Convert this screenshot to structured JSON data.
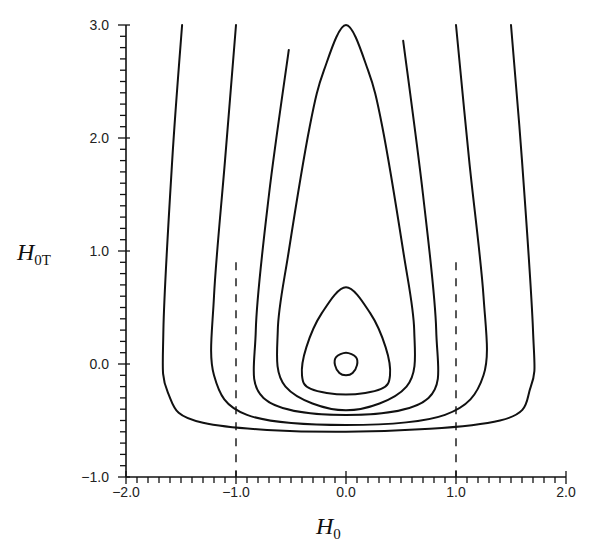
{
  "chart_data": {
    "type": "line",
    "title": "",
    "xlabel": "H_0",
    "ylabel": "H_0T",
    "xlabel_main": "H",
    "xlabel_sub": "0",
    "ylabel_main": "H",
    "ylabel_sub": "0T",
    "xlim": [
      -2.0,
      2.0
    ],
    "ylim": [
      -1.0,
      3.0
    ],
    "x_ticks": [
      "-2.0",
      "-1.0",
      "0.0",
      "1.0",
      "2.0"
    ],
    "y_ticks": [
      "-1.0",
      "0.0",
      "1.0",
      "2.0",
      "3.0"
    ],
    "x_tick_values": [
      -2.0,
      -1.0,
      0.0,
      1.0,
      2.0
    ],
    "y_tick_values": [
      -1.0,
      0.0,
      1.0,
      2.0,
      3.0
    ],
    "minor_tick_step": 0.1,
    "grid": false,
    "legend": null,
    "reference_lines": [
      {
        "style": "dashed",
        "x": -1.0,
        "y_range": [
          -1.0,
          0.9
        ]
      },
      {
        "style": "dashed",
        "x": 1.0,
        "y_range": [
          -1.0,
          0.9
        ]
      }
    ],
    "series": [
      {
        "name": "closed-contour-small",
        "closed": true,
        "x": [
          0.0,
          0.09,
          0.1,
          0.06,
          0.0,
          -0.06,
          -0.1,
          -0.09,
          0.0
        ],
        "y": [
          0.1,
          0.06,
          -0.01,
          -0.08,
          -0.1,
          -0.08,
          -0.01,
          0.06,
          0.1
        ]
      },
      {
        "name": "closed-contour-egg",
        "closed": true,
        "x": [
          0.0,
          0.22,
          0.36,
          0.4,
          0.32,
          0.0,
          -0.32,
          -0.4,
          -0.36,
          -0.22,
          0.0
        ],
        "y": [
          0.68,
          0.45,
          0.15,
          -0.1,
          -0.22,
          -0.27,
          -0.22,
          -0.1,
          0.15,
          0.45,
          0.68
        ]
      },
      {
        "name": "closed-contour-teardrop",
        "closed": true,
        "x": [
          0.0,
          0.2,
          0.33,
          0.52,
          0.62,
          0.55,
          0.0,
          -0.55,
          -0.62,
          -0.52,
          -0.33,
          -0.2,
          0.0
        ],
        "y": [
          3.0,
          2.6,
          2.1,
          1.0,
          0.3,
          -0.2,
          -0.41,
          -0.2,
          0.3,
          1.0,
          2.1,
          2.6,
          3.0
        ]
      },
      {
        "name": "open-contour-inner",
        "closed": false,
        "x": [
          -0.52,
          -0.7,
          -0.82,
          -0.75,
          0.0,
          0.75,
          0.82,
          0.7,
          0.52
        ],
        "y": [
          2.78,
          1.5,
          0.3,
          -0.3,
          -0.45,
          -0.3,
          0.3,
          1.5,
          2.86
        ]
      },
      {
        "name": "open-contour-middle",
        "closed": false,
        "x": [
          -1.0,
          -1.1,
          -1.2,
          -1.2,
          -0.9,
          0.0,
          0.9,
          1.25,
          1.25,
          1.12,
          1.0
        ],
        "y": [
          3.0,
          1.8,
          0.6,
          -0.1,
          -0.45,
          -0.54,
          -0.45,
          -0.1,
          0.6,
          1.8,
          3.0
        ]
      },
      {
        "name": "open-contour-outer",
        "closed": false,
        "x": [
          -1.49,
          -1.58,
          -1.66,
          -1.62,
          -1.3,
          0.0,
          1.4,
          1.68,
          1.7,
          1.6,
          1.5
        ],
        "y": [
          3.0,
          1.8,
          0.3,
          -0.25,
          -0.52,
          -0.6,
          -0.5,
          -0.2,
          0.3,
          1.8,
          3.0
        ]
      }
    ]
  }
}
